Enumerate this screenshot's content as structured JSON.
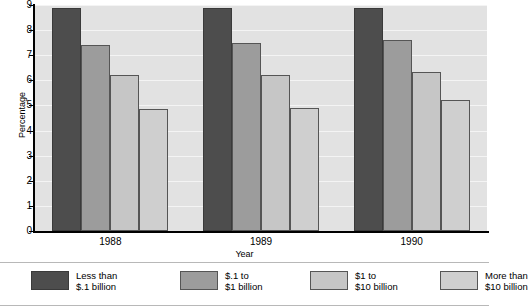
{
  "chart_data": {
    "type": "bar",
    "title": "",
    "xlabel": "Year",
    "ylabel": "Percentage",
    "categories": [
      "1988",
      "1989",
      "1990"
    ],
    "ylim": [
      0,
      9
    ],
    "yticks": [
      0,
      1,
      2,
      3,
      4,
      5,
      6,
      7,
      8,
      9
    ],
    "ytick_labels": [
      "0",
      "1",
      "2",
      "3",
      "4",
      "5",
      "6",
      "7",
      "8",
      "9"
    ],
    "grid": true,
    "legend_position": "bottom",
    "series": [
      {
        "name": "Less than $.1 billion",
        "label_line1": "Less than",
        "label_line2": "$.1 billion",
        "color": "#4d4d4d",
        "values": [
          8.9,
          8.9,
          8.9
        ]
      },
      {
        "name": "$.1 to $1 billion",
        "label_line1": "$.1 to",
        "label_line2": "$1 billion",
        "color": "#9c9c9c",
        "values": [
          7.4,
          7.5,
          7.6
        ]
      },
      {
        "name": "$1 to $10 billion",
        "label_line1": "$1 to",
        "label_line2": "$10 billion",
        "color": "#c6c6c6",
        "values": [
          6.2,
          6.2,
          6.35
        ]
      },
      {
        "name": "More than $10 billion",
        "label_line1": "More than",
        "label_line2": "$10 billion",
        "color": "#cfcfcf",
        "values": [
          4.85,
          4.9,
          5.2
        ]
      }
    ]
  }
}
